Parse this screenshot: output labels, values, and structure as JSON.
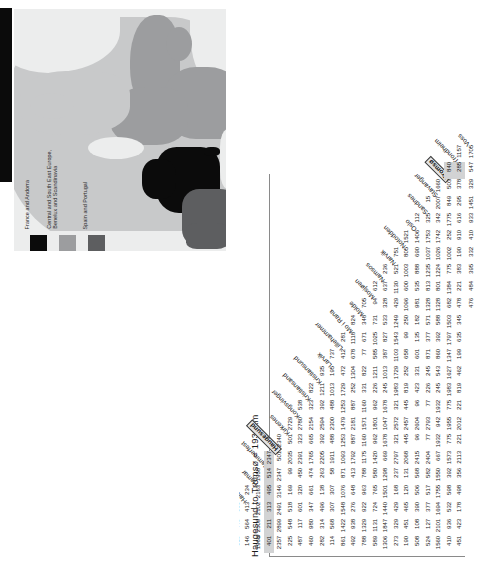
{
  "figure": {
    "title": "Haugesund to Tromsø = 1932km",
    "highlight_value": "1932",
    "highlight_row_city": "Haugesund",
    "highlight_col_city": "Tromsø"
  },
  "map": {
    "name": "europe-region-map",
    "legend": [
      {
        "label_lines": [
          "France and Andorra"
        ],
        "color": "#0b0b0b"
      },
      {
        "label_lines": [
          "Central and South East Europe,",
          "Benelux and Scandinavia"
        ],
        "color": "#9c9d9f"
      },
      {
        "label_lines": [
          "Spain and Portugal"
        ],
        "color": "#5d5e60"
      }
    ]
  },
  "chart_data": {
    "type": "table",
    "title": "Haugesund to Tromsø = 1932km",
    "subtitle": "Norwegian inter-city road distances (km) — lower-triangular matrix",
    "xlabel": "",
    "ylabel": "",
    "grid": false,
    "legend_position": "none",
    "row_labels": [
      "Fagernes",
      "Flekkefjord",
      "Førde",
      "Halden",
      "Hamar",
      "Hammerfest",
      "Haugesund",
      "Kirkenes",
      "Kongsvinger",
      "Kristiansand",
      "Kristiansund",
      "Larvik",
      "Lillehammer",
      "Mo i Rana",
      "Molde",
      "Mosjøen",
      "Namsos",
      "Narvik",
      "Notodden",
      "Oslo",
      "Sandnes",
      "Stavanger",
      "Tromsø",
      "Trondheim",
      "Voss"
    ],
    "col_labels": [
      "Fagernes",
      "Flekkefjord",
      "Førde",
      "Halden",
      "Hamar",
      "Hammerfest",
      "Haugesund",
      "Kirkenes",
      "Kongsvinger",
      "Kristiansand",
      "Kristiansund",
      "Larvik",
      "Lillehammer",
      "Mo i Rana",
      "Molde",
      "Mosjøen",
      "Namsos",
      "Narvik",
      "Notodden",
      "Oslo",
      "Sandnes",
      "Stavanger",
      "Tromsø",
      "Trondheim",
      "Voss"
    ],
    "units": "km",
    "rows": [
      {
        "city": "Flekkefjord",
        "values": [
          "578"
        ]
      },
      {
        "city": "Førde",
        "values": [
          "283",
          "498"
        ]
      },
      {
        "city": "Halden",
        "values": [
          "310",
          "449",
          "555"
        ]
      },
      {
        "city": "Hamar",
        "values": [
          "146",
          "564",
          "413",
          "234"
        ]
      },
      {
        "city": "Hammerfest",
        "values": [
          "1968",
          "2509",
          "2102",
          "2163",
          "1958"
        ]
      },
      {
        "city": "Haugesund",
        "values": [
          "401",
          "211",
          "313",
          "495",
          "514",
          "2347"
        ]
      },
      {
        "city": "Kirkenes",
        "values": [
          "2357",
          "2899",
          "2491",
          "3146",
          "2347",
          "501",
          "2340"
        ]
      },
      {
        "city": "Kongsvinger",
        "values": [
          "225",
          "548",
          "518",
          "169",
          "99",
          "2035",
          "501",
          "2729"
        ]
      },
      {
        "city": "Kristiansand",
        "values": [
          "487",
          "117",
          "601",
          "320",
          "450",
          "2391",
          "323",
          "2780",
          "538"
        ]
      },
      {
        "city": "Kristiansund",
        "values": [
          "460",
          "980",
          "347",
          "661",
          "474",
          "1765",
          "665",
          "2154",
          "323",
          "822"
        ]
      },
      {
        "city": "Larvik",
        "values": [
          "282",
          "314",
          "496",
          "138",
          "263",
          "2205",
          "392",
          "2594",
          "392",
          "1211",
          "935"
        ]
      },
      {
        "city": "Lillehammer",
        "values": [
          "114",
          "568",
          "307",
          "307",
          "58",
          "1911",
          "488",
          "2300",
          "488",
          "1013",
          "195",
          "737"
        ]
      },
      {
        "city": "Mo i Rana",
        "values": [
          "861",
          "1422",
          "1548",
          "1076",
          "871",
          "1093",
          "1253",
          "1479",
          "1253",
          "1729",
          "472",
          "412",
          "281"
        ]
      },
      {
        "city": "Molde",
        "values": [
          "492",
          "938",
          "276",
          "648",
          "413",
          "1792",
          "887",
          "2181",
          "887",
          "252",
          "1304",
          "678",
          "1118",
          "824"
        ]
      },
      {
        "city": "Mosjøen",
        "values": [
          "788",
          "1329",
          "922",
          "963",
          "788",
          "1175",
          "1160",
          "1571",
          "1160",
          "331",
          "822",
          "77",
          "671",
          "348",
          "705"
        ]
      },
      {
        "city": "Namsos",
        "values": [
          "589",
          "1131",
          "724",
          "765",
          "580",
          "1420",
          "962",
          "1801",
          "962",
          "226",
          "1211",
          "585",
          "1025",
          "731",
          "94",
          "612"
        ]
      },
      {
        "city": "Narvik",
        "values": [
          "1306",
          "1847",
          "1440",
          "1501",
          "1298",
          "669",
          "1678",
          "1047",
          "1678",
          "245",
          "1013",
          "387",
          "827",
          "533",
          "328",
          "637",
          "236"
        ]
      },
      {
        "city": "Notodden",
        "values": [
          "273",
          "329",
          "429",
          "168",
          "237",
          "2797",
          "321",
          "2572",
          "321",
          "1983",
          "1729",
          "1103",
          "1543",
          "1249",
          "429",
          "1130",
          "521",
          "751"
        ]
      },
      {
        "city": "Oslo",
        "values": [
          "190",
          "451",
          "465",
          "120",
          "131",
          "2068",
          "445",
          "2457",
          "445",
          "819",
          "252",
          "658",
          "99",
          "250",
          "1096",
          "600",
          "1003",
          "805",
          "1521"
        ]
      },
      {
        "city": "Sandnes",
        "values": [
          "508",
          "108",
          "390",
          "506",
          "568",
          "2415",
          "96",
          "2604",
          "96",
          "423",
          "331",
          "601",
          "135",
          "182",
          "981",
          "535",
          "888",
          "690",
          "1406",
          "112"
        ]
      },
      {
        "city": "Stavanger",
        "values": [
          "524",
          "127",
          "377",
          "517",
          "582",
          "2404",
          "77",
          "2793",
          "77",
          "226",
          "245",
          "871",
          "377",
          "571",
          "1328",
          "813",
          "1235",
          "1037",
          "1753",
          "325",
          "15"
        ]
      },
      {
        "city": "Tromsø",
        "values": [
          "1560",
          "2101",
          "1694",
          "1755",
          "1550",
          "667",
          "1932",
          "942",
          "1932",
          "245",
          "543",
          "860",
          "392",
          "588",
          "1328",
          "801",
          "1224",
          "1026",
          "1742",
          "342",
          "2007",
          "1660"
        ]
      },
      {
        "city": "Trondheim",
        "values": [
          "410",
          "936",
          "532",
          "598",
          "392",
          "1573",
          "775",
          "1955",
          "775",
          "1983",
          "1627",
          "1347",
          "1797",
          "1503",
          "682",
          "1384",
          "775",
          "1002",
          "252",
          "1775",
          "849",
          "503",
          "840"
        ]
      },
      {
        "city": "Voss",
        "values": [
          "451",
          "423",
          "178",
          "498",
          "356",
          "2113",
          "221",
          "2012",
          "221",
          "819",
          "462",
          "199",
          "635",
          "345",
          "478",
          "221",
          "383",
          "190",
          "910",
          "616",
          "295",
          "378",
          "285",
          "1157"
        ]
      }
    ],
    "secondary_tail": {
      "note": "final short row beneath Voss",
      "values": [
        "476",
        "484",
        "395",
        "332",
        "410",
        "933",
        "1451",
        "329",
        "547",
        "1705"
      ]
    }
  }
}
